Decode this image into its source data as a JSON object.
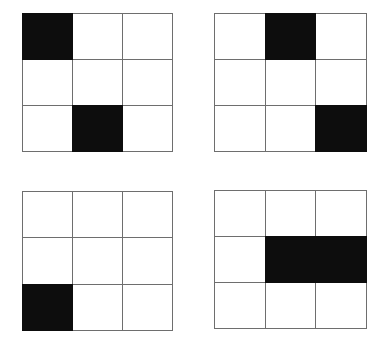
{
  "figure": {
    "title": "",
    "background_color": "#ffffff",
    "line_color": "#6e6e6e",
    "fill_color": "#0d0d0d",
    "empty_color": "#ffffff",
    "rows": 3,
    "columns": 3,
    "panel_count": 4
  },
  "panels": [
    {
      "id": "top-left",
      "position": "top-left",
      "label": "",
      "filled_count": 2,
      "filled_cells": [
        [
          0,
          0
        ],
        [
          2,
          1
        ]
      ],
      "cells": [
        [
          {
            "state": "filled",
            "label": ""
          },
          {
            "state": "empty",
            "label": ""
          },
          {
            "state": "empty",
            "label": ""
          }
        ],
        [
          {
            "state": "empty",
            "label": ""
          },
          {
            "state": "empty",
            "label": ""
          },
          {
            "state": "empty",
            "label": ""
          }
        ],
        [
          {
            "state": "empty",
            "label": ""
          },
          {
            "state": "filled",
            "label": ""
          },
          {
            "state": "empty",
            "label": ""
          }
        ]
      ]
    },
    {
      "id": "top-right",
      "position": "top-right",
      "label": "",
      "filled_count": 2,
      "filled_cells": [
        [
          0,
          1
        ],
        [
          2,
          2
        ]
      ],
      "cells": [
        [
          {
            "state": "empty",
            "label": ""
          },
          {
            "state": "filled",
            "label": ""
          },
          {
            "state": "empty",
            "label": ""
          }
        ],
        [
          {
            "state": "empty",
            "label": ""
          },
          {
            "state": "empty",
            "label": ""
          },
          {
            "state": "empty",
            "label": ""
          }
        ],
        [
          {
            "state": "empty",
            "label": ""
          },
          {
            "state": "empty",
            "label": ""
          },
          {
            "state": "filled",
            "label": ""
          }
        ]
      ]
    },
    {
      "id": "bottom-left",
      "position": "bottom-left",
      "label": "",
      "filled_count": 1,
      "filled_cells": [
        [
          2,
          0
        ]
      ],
      "cells": [
        [
          {
            "state": "empty",
            "label": ""
          },
          {
            "state": "empty",
            "label": ""
          },
          {
            "state": "empty",
            "label": ""
          }
        ],
        [
          {
            "state": "empty",
            "label": ""
          },
          {
            "state": "empty",
            "label": ""
          },
          {
            "state": "empty",
            "label": ""
          }
        ],
        [
          {
            "state": "filled",
            "label": ""
          },
          {
            "state": "empty",
            "label": ""
          },
          {
            "state": "empty",
            "label": ""
          }
        ]
      ]
    },
    {
      "id": "bottom-right",
      "position": "bottom-right",
      "label": "",
      "filled_count": 2,
      "filled_cells": [
        [
          1,
          1
        ],
        [
          1,
          2
        ]
      ],
      "cells": [
        [
          {
            "state": "empty",
            "label": ""
          },
          {
            "state": "empty",
            "label": ""
          },
          {
            "state": "empty",
            "label": ""
          }
        ],
        [
          {
            "state": "empty",
            "label": ""
          },
          {
            "state": "filled",
            "label": ""
          },
          {
            "state": "filled",
            "label": ""
          }
        ],
        [
          {
            "state": "empty",
            "label": ""
          },
          {
            "state": "empty",
            "label": ""
          },
          {
            "state": "empty",
            "label": ""
          }
        ]
      ]
    }
  ]
}
